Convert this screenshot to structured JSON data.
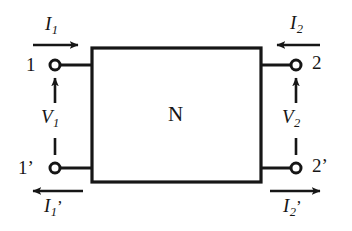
{
  "figure": {
    "background_color": "#ffffff",
    "line_color": "#161616",
    "network": {
      "label": "N",
      "description": "two-port network block"
    },
    "terminals": [
      {
        "id": "terminal-1",
        "label": "1",
        "position": "top-left"
      },
      {
        "id": "terminal-2",
        "label": "2",
        "position": "top-right"
      },
      {
        "id": "terminal-1p",
        "label": "1’",
        "position": "bottom-left"
      },
      {
        "id": "terminal-2p",
        "label": "2’",
        "position": "bottom-right"
      }
    ],
    "currents": [
      {
        "id": "current-i1",
        "symbol": "I",
        "subscript": "1",
        "prime": "",
        "direction": "right",
        "position": "top-left"
      },
      {
        "id": "current-i2",
        "symbol": "I",
        "subscript": "2",
        "prime": "",
        "direction": "left",
        "position": "top-right"
      },
      {
        "id": "current-i1p",
        "symbol": "I",
        "subscript": "1",
        "prime": "’",
        "direction": "left",
        "position": "bottom-left"
      },
      {
        "id": "current-i2p",
        "symbol": "I",
        "subscript": "2",
        "prime": "’",
        "direction": "right",
        "position": "bottom-right"
      }
    ],
    "voltages": [
      {
        "id": "voltage-v1",
        "symbol": "V",
        "subscript": "1",
        "polarity_arrow": "up",
        "position": "left"
      },
      {
        "id": "voltage-v2",
        "symbol": "V",
        "subscript": "2",
        "polarity_arrow": "up",
        "position": "right"
      }
    ]
  }
}
